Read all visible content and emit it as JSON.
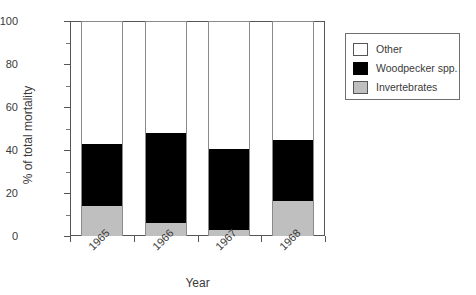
{
  "chart_data": {
    "type": "bar",
    "subtype": "stacked-column",
    "title": "",
    "xlabel": "Year",
    "ylabel": "% of total mortality",
    "categories": [
      "1965",
      "1966",
      "1967",
      "1968"
    ],
    "ylim": [
      0,
      100
    ],
    "yticks": [
      0,
      20,
      40,
      60,
      80,
      100
    ],
    "ytick_labels": [
      "0",
      "20",
      "40",
      "60",
      "80",
      "100"
    ],
    "yminor_ticks": [
      10,
      30,
      50,
      70,
      90
    ],
    "grid": false,
    "legend_position": "right-outside",
    "series": [
      {
        "name": "Invertebrates",
        "color": "#bfbfbf",
        "values": [
          14.4,
          6.5,
          3.3,
          16.7
        ]
      },
      {
        "name": "Woodpecker spp.",
        "color": "#000000",
        "values": [
          28.9,
          41.9,
          37.6,
          28.4
        ]
      },
      {
        "name": "Other",
        "color": "#ffffff",
        "values": [
          56.7,
          51.6,
          59.1,
          54.9
        ]
      }
    ],
    "cumulative_tops": {
      "invertebrates": [
        14.4,
        6.5,
        3.3,
        16.7
      ],
      "woodpecker": [
        43.3,
        48.4,
        40.9,
        45.1
      ],
      "other": [
        100,
        100,
        100,
        100
      ]
    },
    "xtick_label_rotation": -45
  },
  "legend": {
    "items": [
      {
        "label": "Other",
        "swatch": "white-swatch"
      },
      {
        "label": "Woodpecker spp.",
        "swatch": "black-swatch"
      },
      {
        "label": "Invertebrates",
        "swatch": "gray-swatch"
      }
    ]
  },
  "axes": {
    "y_title": "% of total mortality",
    "x_title": "Year"
  },
  "colors": {
    "invertebrates": "#bfbfbf",
    "woodpecker": "#000000",
    "other": "#ffffff",
    "axis": "#555555",
    "text": "#3a3a3a",
    "background": "#ffffff"
  }
}
